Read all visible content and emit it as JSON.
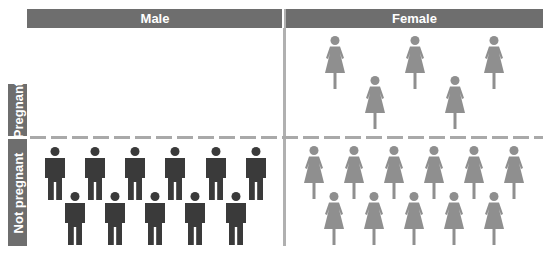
{
  "columns": [
    {
      "label": "Male"
    },
    {
      "label": "Female"
    }
  ],
  "rows": [
    {
      "label": "Pregnant"
    },
    {
      "label": "Not pregnant"
    }
  ],
  "colors": {
    "header_bg": "#6e6e6e",
    "male_icon": "#3a3a3a",
    "female_icon": "#8f8f8f",
    "divider": "#b0b0b0"
  },
  "cells": {
    "male_pregnant": {
      "count": 0
    },
    "male_not_pregnant": {
      "count": 11
    },
    "female_pregnant": {
      "count": 5
    },
    "female_not_pregnant": {
      "count": 11
    }
  }
}
